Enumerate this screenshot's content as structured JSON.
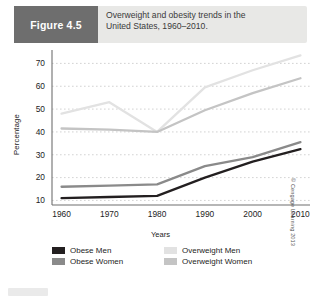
{
  "figure": {
    "tag_label": "Figure 4.5",
    "caption_line1": "Overweight and obesity trends in the",
    "caption_line2": "United States, 1960–2010."
  },
  "copyright": "© Cengage Learning 2013",
  "colors": {
    "obese_men": "#231f20",
    "obese_women": "#8a8a8a",
    "overweight_men": "#e2e2e2",
    "overweight_women": "#c4c4c4",
    "tag_bg": "#6e6e6e",
    "header_bg": "#e8e8e6",
    "axis": "#6f6f6f",
    "grid": "#c8c8c8"
  },
  "legend": {
    "items": [
      {
        "label": "Obese Men",
        "color": "#231f20"
      },
      {
        "label": "Overweight Men",
        "color": "#e2e2e2"
      },
      {
        "label": "Obese Women",
        "color": "#8a8a8a"
      },
      {
        "label": "Overweight Women",
        "color": "#c4c4c4"
      }
    ]
  },
  "chart_data": {
    "type": "line",
    "title": "Overweight and obesity trends in the United States, 1960–2010.",
    "xlabel": "Years",
    "ylabel": "Percentage",
    "categories": [
      1960,
      1970,
      1980,
      1990,
      2000,
      2010
    ],
    "xtick_labels": [
      "1960",
      "1970",
      "1980",
      "1990",
      "2000",
      "2010"
    ],
    "ytick_labels": [
      "10",
      "20",
      "30",
      "40",
      "50",
      "60",
      "70"
    ],
    "yticks": [
      10,
      20,
      30,
      40,
      50,
      60,
      70
    ],
    "ylim": [
      8,
      75
    ],
    "xlim": [
      1958,
      2012
    ],
    "grid": "horizontal-dotted",
    "legend_position": "below-left",
    "series": [
      {
        "name": "Obese Men",
        "color": "#231f20",
        "values": [
          11,
          11.5,
          12,
          20,
          27,
          32.5
        ]
      },
      {
        "name": "Obese Women",
        "color": "#8a8a8a",
        "values": [
          16,
          16.5,
          17,
          25,
          29,
          35.5
        ]
      },
      {
        "name": "Overweight Men",
        "color": "#e2e2e2",
        "values": [
          48,
          53,
          40,
          59.5,
          67,
          73.5
        ]
      },
      {
        "name": "Overweight Women",
        "color": "#c4c4c4",
        "values": [
          41.5,
          41,
          40,
          49.5,
          57,
          63.5
        ]
      }
    ]
  }
}
